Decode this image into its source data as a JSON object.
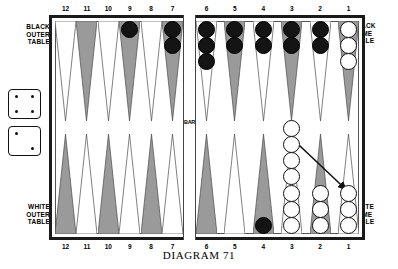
{
  "caption": "DIAGRAM 71",
  "bar": {
    "label": "BAR"
  },
  "labels": {
    "black_outer": "BLACK\nOUTER\nTABLE",
    "black_home": "BLACK\nHOME\nTABLE",
    "white_outer": "WHITE\nOUTER\nTABLE",
    "white_home": "WHITE\nHOME\nTABLE"
  },
  "colors": {
    "black_checker": "#141414",
    "white_checker": "#ffffff",
    "point_shaded": "#9a9a9a",
    "point_light": "#ffffff",
    "frame": "#1a1a1a"
  },
  "dice": [
    {
      "name": "die-top",
      "value": 4
    },
    {
      "name": "die-bottom",
      "value": 2
    }
  ],
  "point_numbers": {
    "top": [
      "12",
      "11",
      "10",
      "9",
      "8",
      "7",
      "6",
      "5",
      "4",
      "3",
      "2",
      "1"
    ],
    "bottom": [
      "12",
      "11",
      "10",
      "9",
      "8",
      "7",
      "6",
      "5",
      "4",
      "3",
      "2",
      "1"
    ]
  },
  "board": {
    "top_left_quadrant": {
      "name": "black-outer-table",
      "points": [
        {
          "number": "12",
          "shade": "light",
          "checkers": 0,
          "color": null
        },
        {
          "number": "11",
          "shade": "shaded",
          "checkers": 0,
          "color": null
        },
        {
          "number": "10",
          "shade": "light",
          "checkers": 0,
          "color": null
        },
        {
          "number": "9",
          "shade": "shaded",
          "checkers": 1,
          "color": "black"
        },
        {
          "number": "8",
          "shade": "light",
          "checkers": 0,
          "color": null
        },
        {
          "number": "7",
          "shade": "shaded",
          "checkers": 2,
          "color": "black"
        }
      ]
    },
    "top_right_quadrant": {
      "name": "black-home-table",
      "points": [
        {
          "number": "6",
          "shade": "light",
          "checkers": 3,
          "color": "black"
        },
        {
          "number": "5",
          "shade": "shaded",
          "checkers": 2,
          "color": "black"
        },
        {
          "number": "4",
          "shade": "light",
          "checkers": 2,
          "color": "black"
        },
        {
          "number": "3",
          "shade": "shaded",
          "checkers": 2,
          "color": "black"
        },
        {
          "number": "2",
          "shade": "light",
          "checkers": 2,
          "color": "black"
        },
        {
          "number": "1",
          "shade": "shaded",
          "checkers": 3,
          "color": "white"
        }
      ]
    },
    "bottom_left_quadrant": {
      "name": "white-outer-table",
      "points": [
        {
          "number": "12",
          "shade": "shaded",
          "checkers": 0,
          "color": null
        },
        {
          "number": "11",
          "shade": "light",
          "checkers": 0,
          "color": null
        },
        {
          "number": "10",
          "shade": "shaded",
          "checkers": 0,
          "color": null
        },
        {
          "number": "9",
          "shade": "light",
          "checkers": 0,
          "color": null
        },
        {
          "number": "8",
          "shade": "shaded",
          "checkers": 0,
          "color": null
        },
        {
          "number": "7",
          "shade": "light",
          "checkers": 0,
          "color": null
        }
      ]
    },
    "bottom_right_quadrant": {
      "name": "white-home-table",
      "points": [
        {
          "number": "6",
          "shade": "shaded",
          "checkers": 0,
          "color": null
        },
        {
          "number": "5",
          "shade": "light",
          "checkers": 0,
          "color": null
        },
        {
          "number": "4",
          "shade": "shaded",
          "checkers": 1,
          "color": "black"
        },
        {
          "number": "3",
          "shade": "light",
          "checkers": 7,
          "color": "white"
        },
        {
          "number": "2",
          "shade": "shaded",
          "checkers": 3,
          "color": "white"
        },
        {
          "number": "1",
          "shade": "light",
          "checkers": 3,
          "color": "white"
        }
      ]
    }
  },
  "move_arrow": {
    "name": "move-arrow",
    "from_point": "3",
    "to_point": "1",
    "description": "white checker moves from point 3 to point 1"
  }
}
